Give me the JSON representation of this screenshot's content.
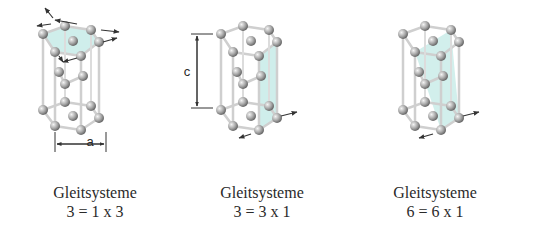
{
  "figure": {
    "colors": {
      "plane": "#bfe8e4",
      "atom": "#9a9a9a",
      "bond": "#d8d8d8",
      "text": "#2a2a2a"
    },
    "panels": [
      {
        "id": "basal",
        "dimension_label": "a",
        "caption_title": "Gleitsysteme",
        "caption_formula": "3 = 1 x 3"
      },
      {
        "id": "prismatic",
        "dimension_label": "c",
        "caption_title": "Gleitsysteme",
        "caption_formula": "3 = 3 x 1"
      },
      {
        "id": "pyramidal",
        "caption_title": "Gleitsysteme",
        "caption_formula": "6 = 6 x 1"
      }
    ]
  }
}
